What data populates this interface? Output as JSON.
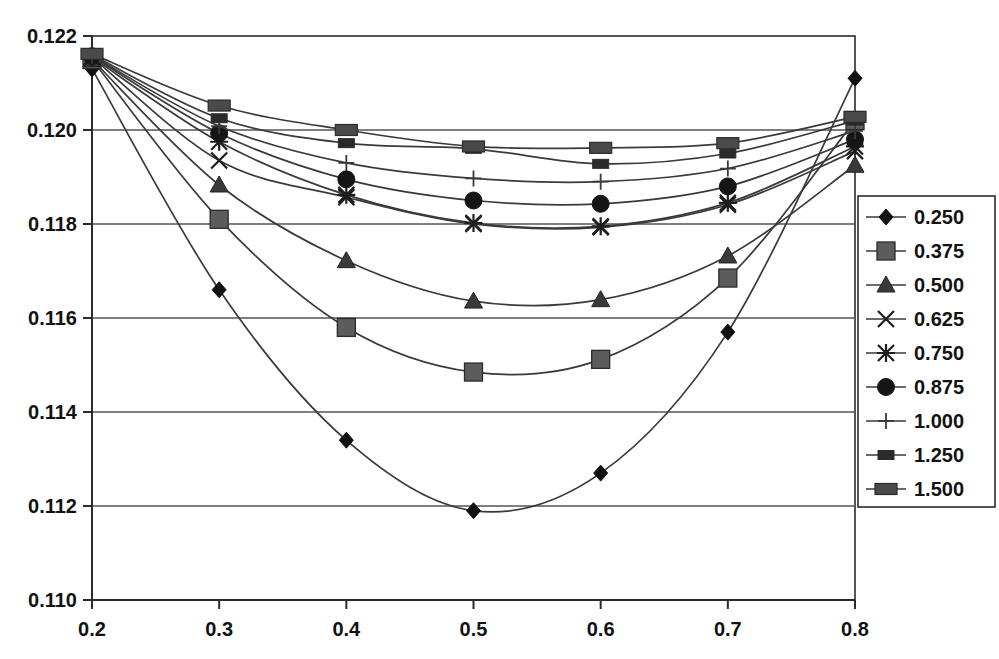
{
  "chart_data": {
    "type": "line",
    "title": "",
    "subtitle": "",
    "xlabel": "",
    "ylabel": "",
    "xlim": [
      0.2,
      0.8
    ],
    "ylim": [
      0.11,
      0.122
    ],
    "x": [
      0.2,
      0.3,
      0.4,
      0.5,
      0.6,
      0.7,
      0.8
    ],
    "x_ticks": [
      "0.2",
      "0.3",
      "0.4",
      "0.5",
      "0.6",
      "0.7",
      "0.8"
    ],
    "y_ticks": [
      "0.110",
      "0.112",
      "0.114",
      "0.116",
      "0.118",
      "0.120",
      "0.122"
    ],
    "grid": "horizontal",
    "legend_position": "right",
    "legend_border": true,
    "line_color": "#3a3a3a",
    "axis_color": "#2b2b2b",
    "grid_color": "#555555",
    "series": [
      {
        "name": "0.250",
        "marker": "diamond",
        "values": [
          0.1213,
          0.1166,
          0.1134,
          0.1119,
          0.1127,
          0.1157,
          0.1211
        ]
      },
      {
        "name": "0.375",
        "marker": "square",
        "values": [
          0.1215,
          0.1181,
          0.1158,
          0.11485,
          0.11512,
          0.11685,
          0.1202
        ]
      },
      {
        "name": "0.500",
        "marker": "triangle",
        "values": [
          0.1215,
          0.11883,
          0.11722,
          0.11636,
          0.11639,
          0.11732,
          0.11925
        ]
      },
      {
        "name": "0.625",
        "marker": "cross",
        "values": [
          0.12155,
          0.11935,
          0.11857,
          0.118,
          0.11793,
          0.11841,
          0.11955
        ]
      },
      {
        "name": "0.750",
        "marker": "asterisk",
        "values": [
          0.12155,
          0.11975,
          0.11862,
          0.11802,
          0.11795,
          0.11845,
          0.11965
        ]
      },
      {
        "name": "0.875",
        "marker": "circle",
        "values": [
          0.12157,
          0.11993,
          0.11895,
          0.1185,
          0.11843,
          0.1188,
          0.1198
        ]
      },
      {
        "name": "1.000",
        "marker": "plus",
        "values": [
          0.12158,
          0.12008,
          0.1193,
          0.11897,
          0.1189,
          0.11918,
          0.11998
        ]
      },
      {
        "name": "1.250",
        "marker": "dash-small",
        "values": [
          0.1216,
          0.12025,
          0.11972,
          0.1196,
          0.11928,
          0.1195,
          0.1202
        ]
      },
      {
        "name": "1.500",
        "marker": "dash-wide",
        "values": [
          0.12162,
          0.12052,
          0.12,
          0.11965,
          0.11962,
          0.11972,
          0.12028
        ]
      }
    ]
  },
  "legend": {
    "entries": [
      "0.250",
      "0.375",
      "0.500",
      "0.625",
      "0.750",
      "0.875",
      "1.000",
      "1.250",
      "1.500"
    ]
  }
}
